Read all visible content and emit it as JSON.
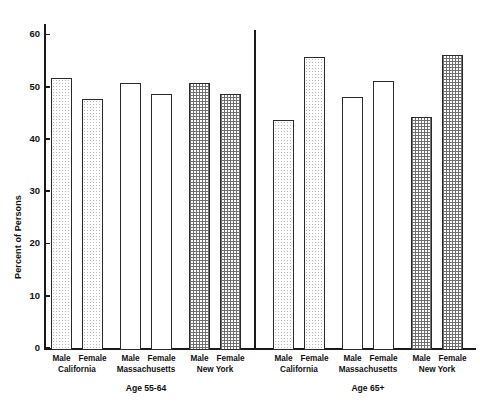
{
  "chart_data": {
    "type": "bar",
    "title": "",
    "xlabel": "",
    "ylabel": "Percent of Persons",
    "ylim": [
      0,
      62
    ],
    "yticks": [
      0,
      10,
      20,
      30,
      40,
      50,
      60
    ],
    "ytick_labels": [
      "0",
      "10",
      "20",
      "30",
      "40",
      "50",
      "60"
    ],
    "grid": false,
    "legend": "none",
    "age_groups": [
      {
        "label": "Age 55-64",
        "states": [
          {
            "name": "California",
            "pattern": "dots",
            "bars": [
              {
                "sex": "Male",
                "value": 52
              },
              {
                "sex": "Female",
                "value": 48
              }
            ]
          },
          {
            "name": "Massachusetts",
            "pattern": "none",
            "bars": [
              {
                "sex": "Male",
                "value": 51
              },
              {
                "sex": "Female",
                "value": 49
              }
            ]
          },
          {
            "name": "New York",
            "pattern": "check",
            "bars": [
              {
                "sex": "Male",
                "value": 51
              },
              {
                "sex": "Female",
                "value": 49
              }
            ]
          }
        ]
      },
      {
        "label": "Age 65+",
        "states": [
          {
            "name": "California",
            "pattern": "dots",
            "bars": [
              {
                "sex": "Male",
                "value": 44
              },
              {
                "sex": "Female",
                "value": 56
              }
            ]
          },
          {
            "name": "Massachusetts",
            "pattern": "none",
            "bars": [
              {
                "sex": "Male",
                "value": 48.5
              },
              {
                "sex": "Female",
                "value": 51.5
              }
            ]
          },
          {
            "name": "New York",
            "pattern": "check",
            "bars": [
              {
                "sex": "Male",
                "value": 44.5
              },
              {
                "sex": "Female",
                "value": 56.5
              }
            ]
          }
        ]
      }
    ],
    "categories": [
      "Age 55-64 / California / Male",
      "Age 55-64 / California / Female",
      "Age 55-64 / Massachusetts / Male",
      "Age 55-64 / Massachusetts / Female",
      "Age 55-64 / New York / Male",
      "Age 55-64 / New York / Female",
      "Age 65+ / California / Male",
      "Age 65+ / California / Female",
      "Age 65+ / Massachusetts / Male",
      "Age 65+ / Massachusetts / Female",
      "Age 65+ / New York / Male",
      "Age 65+ / New York / Female"
    ],
    "values": [
      52,
      48,
      51,
      49,
      51,
      49,
      44,
      56,
      48.5,
      51.5,
      44.5,
      56.5
    ],
    "colors": {
      "axis": "#1a1a1a",
      "bar_outline": "#2a2a2a",
      "dots_fill": "#b9b9b9",
      "check_fill": "#6f6f6f",
      "plain_fill": "#ffffff",
      "background": "#ffffff"
    }
  }
}
